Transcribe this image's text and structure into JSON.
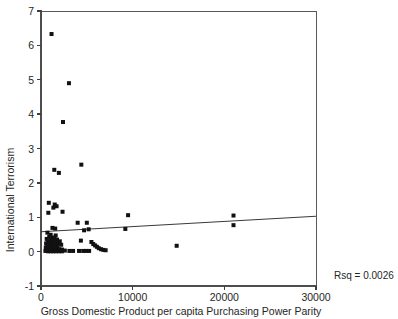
{
  "figure": {
    "title": "",
    "rsq_annotation": "Rsq = 0.0026"
  },
  "chart_data": {
    "type": "scatter",
    "title": "",
    "xlabel": "Gross Domestic Product per capita Purchasing Power Parity",
    "ylabel": "International Terrorism",
    "xlim": [
      0,
      30000
    ],
    "ylim": [
      -1,
      7
    ],
    "xticks": [
      0,
      10000,
      20000,
      30000
    ],
    "xtick_labels": [
      "0",
      "10000",
      "20000",
      "30000"
    ],
    "yticks": [
      -1,
      0,
      1,
      2,
      3,
      4,
      5,
      6,
      7
    ],
    "ytick_labels": [
      "-1",
      "0",
      "1",
      "2",
      "3",
      "4",
      "5",
      "6",
      "7"
    ],
    "grid": false,
    "legend": null,
    "annotations": [
      {
        "text": "Rsq = 0.0026",
        "x": 31500,
        "y": -0.55
      }
    ],
    "fit_line": {
      "type": "linear-regression",
      "r_squared": 0.0026,
      "x_start": 0,
      "y_start": 0.58,
      "x_end": 30000,
      "y_end": 1.03
    },
    "marker": {
      "shape": "square",
      "size": 4,
      "color": "#111111"
    },
    "points": [
      {
        "x": 1150,
        "y": 6.33
      },
      {
        "x": 3050,
        "y": 4.9
      },
      {
        "x": 2400,
        "y": 3.77
      },
      {
        "x": 4400,
        "y": 2.53
      },
      {
        "x": 1450,
        "y": 2.38
      },
      {
        "x": 1950,
        "y": 2.29
      },
      {
        "x": 850,
        "y": 1.42
      },
      {
        "x": 1500,
        "y": 1.37
      },
      {
        "x": 1700,
        "y": 1.32
      },
      {
        "x": 1350,
        "y": 1.28
      },
      {
        "x": 2350,
        "y": 1.16
      },
      {
        "x": 800,
        "y": 1.13
      },
      {
        "x": 9500,
        "y": 1.06
      },
      {
        "x": 21000,
        "y": 1.05
      },
      {
        "x": 4000,
        "y": 0.84
      },
      {
        "x": 5000,
        "y": 0.84
      },
      {
        "x": 21000,
        "y": 0.77
      },
      {
        "x": 1250,
        "y": 0.69
      },
      {
        "x": 1550,
        "y": 0.67
      },
      {
        "x": 5200,
        "y": 0.65
      },
      {
        "x": 9200,
        "y": 0.66
      },
      {
        "x": 4700,
        "y": 0.62
      },
      {
        "x": 700,
        "y": 0.55
      },
      {
        "x": 1050,
        "y": 0.49
      },
      {
        "x": 1600,
        "y": 0.47
      },
      {
        "x": 900,
        "y": 0.43
      },
      {
        "x": 1200,
        "y": 0.41
      },
      {
        "x": 1450,
        "y": 0.39
      },
      {
        "x": 620,
        "y": 0.37
      },
      {
        "x": 1750,
        "y": 0.35
      },
      {
        "x": 1000,
        "y": 0.33
      },
      {
        "x": 1350,
        "y": 0.31
      },
      {
        "x": 2050,
        "y": 0.3
      },
      {
        "x": 760,
        "y": 0.28
      },
      {
        "x": 1150,
        "y": 0.27
      },
      {
        "x": 1550,
        "y": 0.26
      },
      {
        "x": 1900,
        "y": 0.25
      },
      {
        "x": 560,
        "y": 0.24
      },
      {
        "x": 870,
        "y": 0.23
      },
      {
        "x": 1300,
        "y": 0.22
      },
      {
        "x": 1650,
        "y": 0.21
      },
      {
        "x": 2200,
        "y": 0.2
      },
      {
        "x": 680,
        "y": 0.19
      },
      {
        "x": 990,
        "y": 0.18
      },
      {
        "x": 1420,
        "y": 0.17
      },
      {
        "x": 1800,
        "y": 0.16
      },
      {
        "x": 14800,
        "y": 0.17
      },
      {
        "x": 4350,
        "y": 0.32
      },
      {
        "x": 5500,
        "y": 0.28
      },
      {
        "x": 5700,
        "y": 0.22
      },
      {
        "x": 5900,
        "y": 0.18
      },
      {
        "x": 6100,
        "y": 0.14
      },
      {
        "x": 6300,
        "y": 0.1
      },
      {
        "x": 6550,
        "y": 0.07
      },
      {
        "x": 6800,
        "y": 0.05
      },
      {
        "x": 7050,
        "y": 0.04
      },
      {
        "x": 520,
        "y": 0.12
      },
      {
        "x": 800,
        "y": 0.11
      },
      {
        "x": 1080,
        "y": 0.1
      },
      {
        "x": 1380,
        "y": 0.09
      },
      {
        "x": 1700,
        "y": 0.08
      },
      {
        "x": 2000,
        "y": 0.07
      },
      {
        "x": 2300,
        "y": 0.06
      },
      {
        "x": 600,
        "y": 0.05
      },
      {
        "x": 930,
        "y": 0.05
      },
      {
        "x": 1250,
        "y": 0.04
      },
      {
        "x": 1570,
        "y": 0.04
      },
      {
        "x": 1880,
        "y": 0.03
      },
      {
        "x": 2150,
        "y": 0.03
      },
      {
        "x": 2600,
        "y": 0.03
      },
      {
        "x": 3100,
        "y": 0.02
      },
      {
        "x": 3500,
        "y": 0.02
      },
      {
        "x": 4150,
        "y": 0.02
      },
      {
        "x": 4600,
        "y": 0.02
      },
      {
        "x": 4900,
        "y": 0.02
      },
      {
        "x": 5250,
        "y": 0.02
      },
      {
        "x": 480,
        "y": 0.02
      },
      {
        "x": 760,
        "y": 0.01
      },
      {
        "x": 1040,
        "y": 0.01
      },
      {
        "x": 1330,
        "y": 0.01
      },
      {
        "x": 1620,
        "y": 0.01
      },
      {
        "x": 1960,
        "y": 0.01
      },
      {
        "x": 2280,
        "y": 0.01
      }
    ]
  }
}
